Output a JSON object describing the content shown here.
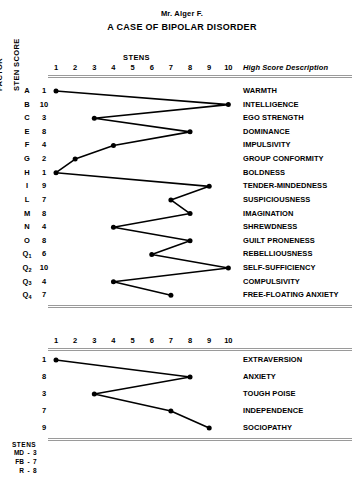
{
  "header": {
    "patient_name": "Mr. Alger F.",
    "title": "A CASE OF BIPOLAR DISORDER"
  },
  "axis": {
    "factor_caption": "FACTOR",
    "sten_caption": "STEN SCORE",
    "stens_label": "STENS",
    "description_header": "High Score Description",
    "ticks": [
      "1",
      "2",
      "3",
      "4",
      "5",
      "6",
      "7",
      "8",
      "9",
      "10"
    ]
  },
  "primary_rows": [
    {
      "code": "A",
      "sub": "",
      "score": 1,
      "description": "WARMTH"
    },
    {
      "code": "B",
      "sub": "",
      "score": 10,
      "description": "INTELLIGENCE"
    },
    {
      "code": "C",
      "sub": "",
      "score": 3,
      "description": "EGO STRENGTH"
    },
    {
      "code": "E",
      "sub": "",
      "score": 8,
      "description": "DOMINANCE"
    },
    {
      "code": "F",
      "sub": "",
      "score": 4,
      "description": "IMPULSIVITY"
    },
    {
      "code": "G",
      "sub": "",
      "score": 2,
      "description": "GROUP CONFORMITY"
    },
    {
      "code": "H",
      "sub": "",
      "score": 1,
      "description": "BOLDNESS"
    },
    {
      "code": "I",
      "sub": "",
      "score": 9,
      "description": "TENDER-MINDEDNESS"
    },
    {
      "code": "L",
      "sub": "",
      "score": 7,
      "description": "SUSPICIOUSNESS"
    },
    {
      "code": "M",
      "sub": "",
      "score": 8,
      "description": "IMAGINATION"
    },
    {
      "code": "N",
      "sub": "",
      "score": 4,
      "description": "SHREWDNESS"
    },
    {
      "code": "O",
      "sub": "",
      "score": 8,
      "description": "GUILT PRONENESS"
    },
    {
      "code": "Q",
      "sub": "1",
      "score": 6,
      "description": "REBELLIOUSNESS"
    },
    {
      "code": "Q",
      "sub": "2",
      "score": 10,
      "description": "SELF-SUFFICIENCY"
    },
    {
      "code": "Q",
      "sub": "3",
      "score": 4,
      "description": "COMPULSIVITY"
    },
    {
      "code": "Q",
      "sub": "4",
      "score": 7,
      "description": "FREE-FLOATING ANXIETY"
    }
  ],
  "secondary_rows": [
    {
      "code": "",
      "sub": "",
      "score": 1,
      "description": "EXTRAVERSION"
    },
    {
      "code": "",
      "sub": "",
      "score": 8,
      "description": "ANXIETY"
    },
    {
      "code": "",
      "sub": "",
      "score": 3,
      "description": "TOUGH POISE"
    },
    {
      "code": "",
      "sub": "",
      "score": 7,
      "description": "INDEPENDENCE"
    },
    {
      "code": "",
      "sub": "",
      "score": 9,
      "description": "SOCIOPATHY"
    }
  ],
  "legend": {
    "title": "STENS",
    "entries": [
      {
        "key": "MD",
        "sep": "-",
        "value": "3"
      },
      {
        "key": "FB",
        "sep": "-",
        "value": "7"
      },
      {
        "key": "R",
        "sep": "-",
        "value": "8"
      }
    ]
  },
  "chart_data": {
    "type": "line",
    "title": "A CASE OF BIPOLAR DISORDER",
    "subtitle": "Mr. Alger F.",
    "xlabel": "STENS",
    "ylabel": "FACTOR / STEN SCORE",
    "xlim": [
      1,
      10
    ],
    "grid": false,
    "legend_position": "none",
    "orientation": "horizontal-profile",
    "series": [
      {
        "name": "16PF Primary Factors",
        "categories": [
          "A",
          "B",
          "C",
          "E",
          "F",
          "G",
          "H",
          "I",
          "L",
          "M",
          "N",
          "O",
          "Q1",
          "Q2",
          "Q3",
          "Q4"
        ],
        "category_descriptions": [
          "WARMTH",
          "INTELLIGENCE",
          "EGO STRENGTH",
          "DOMINANCE",
          "IMPULSIVITY",
          "GROUP CONFORMITY",
          "BOLDNESS",
          "TENDER-MINDEDNESS",
          "SUSPICIOUSNESS",
          "IMAGINATION",
          "SHREWDNESS",
          "GUILT PRONENESS",
          "REBELLIOUSNESS",
          "SELF-SUFFICIENCY",
          "COMPULSIVITY",
          "FREE-FLOATING ANXIETY"
        ],
        "values": [
          1,
          10,
          3,
          8,
          4,
          2,
          1,
          9,
          7,
          8,
          4,
          8,
          6,
          10,
          4,
          7
        ]
      },
      {
        "name": "Second-Order Factors",
        "categories": [
          "EXTRAVERSION",
          "ANXIETY",
          "TOUGH POISE",
          "INDEPENDENCE",
          "SOCIOPATHY"
        ],
        "values": [
          1,
          8,
          3,
          7,
          9
        ]
      }
    ],
    "annotations": [
      {
        "label": "MD",
        "value": 3
      },
      {
        "label": "FB",
        "value": 7
      },
      {
        "label": "R",
        "value": 8
      }
    ]
  }
}
